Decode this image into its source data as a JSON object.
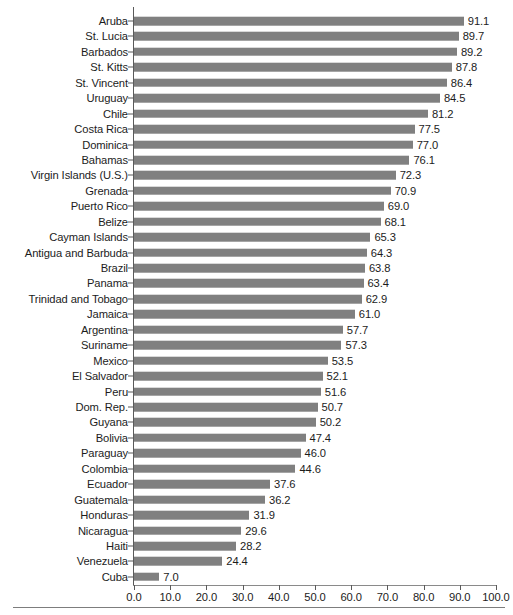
{
  "chart_data": {
    "type": "bar",
    "orientation": "horizontal",
    "title": "",
    "subtitle": "",
    "xlabel": "",
    "ylabel": "",
    "xlim": [
      0.0,
      100.0
    ],
    "xticks": [
      "0.0",
      "10.0",
      "20.0",
      "30.0",
      "40.0",
      "50.0",
      "60.0",
      "70.0",
      "80.0",
      "90.0",
      "100.0"
    ],
    "xtick_values": [
      0,
      10,
      20,
      30,
      40,
      50,
      60,
      70,
      80,
      90,
      100
    ],
    "grid": false,
    "legend": null,
    "bar_color": "#808080",
    "axis_color": "#5a5a5a",
    "text_color": "#1c1c1c",
    "value_label_format": "one-decimal",
    "categories": [
      "Aruba",
      "St. Lucia",
      "Barbados",
      "St. Kitts",
      "St. Vincent",
      "Uruguay",
      "Chile",
      "Costa Rica",
      "Dominica",
      "Bahamas",
      "Virgin Islands (U.S.)",
      "Grenada",
      "Puerto Rico",
      "Belize",
      "Cayman Islands",
      "Antigua and Barbuda",
      "Brazil",
      "Panama",
      "Trinidad and Tobago",
      "Jamaica",
      "Argentina",
      "Suriname",
      "Mexico",
      "El Salvador",
      "Peru",
      "Dom. Rep.",
      "Guyana",
      "Bolivia",
      "Paraguay",
      "Colombia",
      "Ecuador",
      "Guatemala",
      "Honduras",
      "Nicaragua",
      "Haiti",
      "Venezuela",
      "Cuba"
    ],
    "values": [
      91.1,
      89.7,
      89.2,
      87.8,
      86.4,
      84.5,
      81.2,
      77.5,
      77.0,
      76.1,
      72.3,
      70.9,
      69.0,
      68.1,
      65.3,
      64.3,
      63.8,
      63.4,
      62.9,
      61.0,
      57.7,
      57.3,
      53.5,
      52.1,
      51.6,
      50.7,
      50.2,
      47.4,
      46.0,
      44.6,
      37.6,
      36.2,
      31.9,
      29.6,
      28.2,
      24.4,
      7.0
    ],
    "value_labels": [
      "91.1",
      "89.7",
      "89.2",
      "87.8",
      "86.4",
      "84.5",
      "81.2",
      "77.5",
      "77.0",
      "76.1",
      "72.3",
      "70.9",
      "69.0",
      "68.1",
      "65.3",
      "64.3",
      "63.8",
      "63.4",
      "62.9",
      "61.0",
      "57.7",
      "57.3",
      "53.5",
      "52.1",
      "51.6",
      "50.7",
      "50.2",
      "47.4",
      "46.0",
      "44.6",
      "37.6",
      "36.2",
      "31.9",
      "29.6",
      "28.2",
      "24.4",
      "7.0"
    ]
  }
}
